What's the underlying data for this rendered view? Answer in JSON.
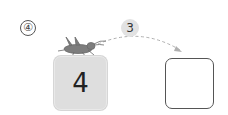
{
  "problem": {
    "number_label": "④",
    "step": "3",
    "start_value": "4",
    "answer_value": "",
    "icon": "grasshopper-icon",
    "colors": {
      "start_box_fill": "#dedede",
      "answer_box_border": "#555555",
      "step_badge_fill": "#e2e2e2",
      "arc": "#b0b0b0"
    }
  }
}
